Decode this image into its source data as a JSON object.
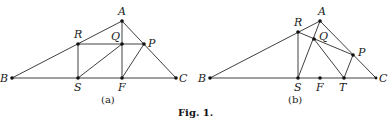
{
  "caption": "Fig. 1.",
  "figures": [
    {
      "id": "a",
      "sublabel": "(a)",
      "points": {
        "A": {
          "label": "A",
          "x": 122,
          "y": 21
        },
        "B": {
          "label": "B",
          "x": 12,
          "y": 78
        },
        "C": {
          "label": "C",
          "x": 176,
          "y": 78
        },
        "R": {
          "label": "R",
          "x": 78,
          "y": 44
        },
        "Q": {
          "label": "Q",
          "x": 122,
          "y": 44
        },
        "P": {
          "label": "P",
          "x": 144,
          "y": 44
        },
        "S": {
          "label": "S",
          "x": 78,
          "y": 78
        },
        "F": {
          "label": "F",
          "x": 122,
          "y": 78
        }
      },
      "segments": [
        [
          "A",
          "B"
        ],
        [
          "A",
          "C"
        ],
        [
          "B",
          "C"
        ],
        [
          "R",
          "P"
        ],
        [
          "R",
          "S"
        ],
        [
          "A",
          "F"
        ],
        [
          "S",
          "Q"
        ],
        [
          "F",
          "P"
        ]
      ]
    },
    {
      "id": "b",
      "sublabel": "(b)",
      "points": {
        "A": {
          "label": "A",
          "x": 320,
          "y": 21
        },
        "B": {
          "label": "B",
          "x": 210,
          "y": 78
        },
        "C": {
          "label": "C",
          "x": 376,
          "y": 78
        },
        "R": {
          "label": "R",
          "x": 298,
          "y": 32
        },
        "Q": {
          "label": "Q",
          "x": 314,
          "y": 39
        },
        "P": {
          "label": "P",
          "x": 353,
          "y": 55
        },
        "S": {
          "label": "S",
          "x": 298,
          "y": 78
        },
        "F": {
          "label": "F",
          "x": 320,
          "y": 78
        },
        "T": {
          "label": "T",
          "x": 344,
          "y": 78
        }
      },
      "segments": [
        [
          "A",
          "B"
        ],
        [
          "A",
          "C"
        ],
        [
          "B",
          "C"
        ],
        [
          "R",
          "S"
        ],
        [
          "R",
          "P"
        ],
        [
          "S",
          "A"
        ],
        [
          "Q",
          "T"
        ],
        [
          "T",
          "P"
        ]
      ]
    }
  ]
}
